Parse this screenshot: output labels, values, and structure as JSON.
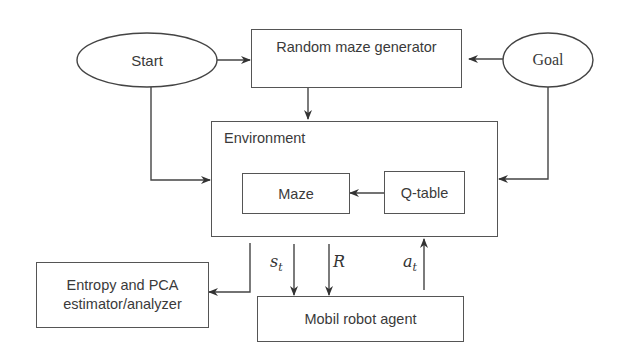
{
  "diagram": {
    "nodes": {
      "start": {
        "label": "Start",
        "shape": "ellipse"
      },
      "goal": {
        "label": "Goal",
        "shape": "ellipse"
      },
      "random_maze_generator": {
        "label": "Random maze generator",
        "shape": "rectangle"
      },
      "environment": {
        "label": "Environment",
        "shape": "rectangle",
        "contains": [
          "maze",
          "q_table"
        ]
      },
      "maze": {
        "label": "Maze",
        "shape": "rectangle"
      },
      "q_table": {
        "label": "Q-table",
        "shape": "rectangle"
      },
      "entropy_pca": {
        "label_line1": "Entropy and PCA",
        "label_line2": "estimator/analyzer",
        "shape": "rectangle"
      },
      "mobil_robot_agent": {
        "label": "Mobil robot agent",
        "shape": "rectangle"
      }
    },
    "edges": [
      {
        "from": "start",
        "to": "random_maze_generator"
      },
      {
        "from": "goal",
        "to": "random_maze_generator"
      },
      {
        "from": "random_maze_generator",
        "to": "environment"
      },
      {
        "from": "start",
        "to": "environment"
      },
      {
        "from": "goal",
        "to": "environment"
      },
      {
        "from": "q_table",
        "to": "maze"
      },
      {
        "from": "environment",
        "to": "entropy_pca"
      },
      {
        "from": "environment",
        "to": "mobil_robot_agent",
        "label": "s_t"
      },
      {
        "from": "environment",
        "to": "mobil_robot_agent",
        "label": "R"
      },
      {
        "from": "mobil_robot_agent",
        "to": "environment",
        "label": "a_t"
      }
    ],
    "edge_labels": {
      "state": {
        "base": "s",
        "sub": "t"
      },
      "reward": {
        "base": "R"
      },
      "action": {
        "base": "a",
        "sub": "t"
      }
    },
    "colors": {
      "stroke": "#555555",
      "text": "#3a3a3a",
      "background": "#ffffff"
    }
  }
}
